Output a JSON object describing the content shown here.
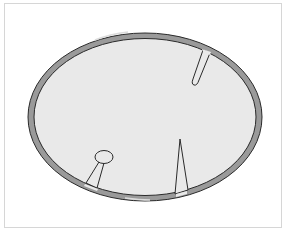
{
  "diagram": {
    "colors": {
      "background": "#ffffff",
      "frame": "#d6d6d6",
      "interior": "#e9e9e9",
      "membrane_fill": "#9a9a9a",
      "membrane_highlight": "#d8d8d8",
      "outline": "#2a2a2a"
    },
    "ellipse": {
      "cx": 145,
      "cy": 117,
      "rx": 116,
      "ry": 83,
      "band": 5
    },
    "structures": [
      {
        "name": "small-drop-protrusion",
        "location": "upper-right"
      },
      {
        "name": "stalked-vesicle-protrusion",
        "location": "lower-left"
      },
      {
        "name": "spike-protrusion",
        "location": "bottom-center"
      }
    ]
  }
}
